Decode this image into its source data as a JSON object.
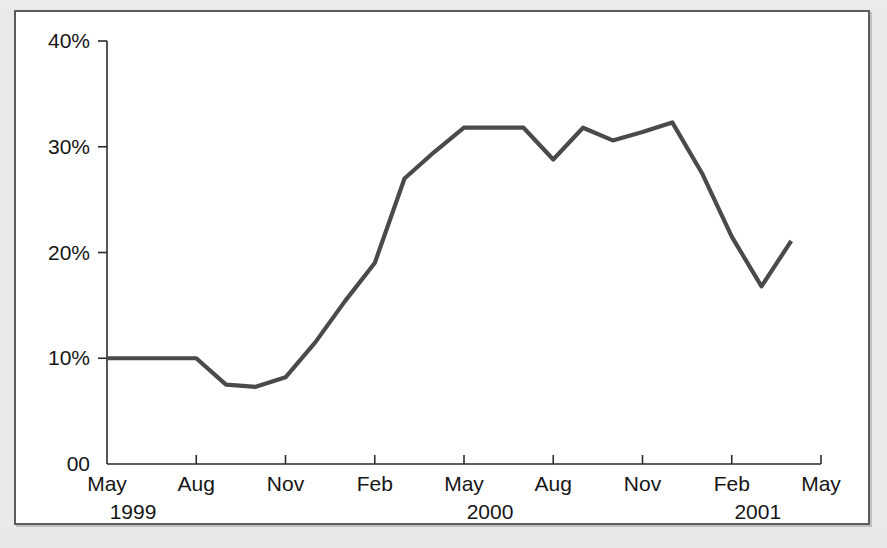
{
  "figure": {
    "panel_name": "chart-figure-panel",
    "background_color": "#ffffff",
    "page_background_color": "#e9e9e7",
    "border_color": "#5c5c5c"
  },
  "chart_data": {
    "type": "line",
    "title": "",
    "subtitle": "",
    "xlabel": "",
    "ylabel": "",
    "ylim": [
      0,
      40
    ],
    "xlim": [
      "May 1999",
      "May 2001"
    ],
    "grid": false,
    "legend": null,
    "legend_position": "none",
    "line_color": "#4a4a4a",
    "line_width_px": 4,
    "y_ticks": [
      {
        "value": 0,
        "label": "00"
      },
      {
        "value": 10,
        "label": "10%"
      },
      {
        "value": 20,
        "label": "20%"
      },
      {
        "value": 30,
        "label": "30%"
      },
      {
        "value": 40,
        "label": "40%"
      }
    ],
    "x_ticks": [
      {
        "month": "May",
        "year": "1999",
        "index": 0
      },
      {
        "month": "Aug",
        "year": "",
        "index": 3
      },
      {
        "month": "Nov",
        "year": "",
        "index": 6
      },
      {
        "month": "Feb",
        "year": "",
        "index": 9
      },
      {
        "month": "May",
        "year": "2000",
        "index": 12
      },
      {
        "month": "Aug",
        "year": "",
        "index": 15
      },
      {
        "month": "Nov",
        "year": "",
        "index": 18
      },
      {
        "month": "Feb",
        "year": "2001",
        "index": 21
      },
      {
        "month": "May",
        "year": "",
        "index": 24
      }
    ],
    "x_axis_year_labels": [
      {
        "label": "1999",
        "index": 0
      },
      {
        "label": "2000",
        "index": 12
      },
      {
        "label": "2001",
        "index": 21
      }
    ],
    "series": [
      {
        "name": "percentage",
        "x": [
          "May 1999",
          "Jun 1999",
          "Jul 1999",
          "Aug 1999",
          "Sep 1999",
          "Oct 1999",
          "Nov 1999",
          "Dec 1999",
          "Jan 2000",
          "Feb 2000",
          "Mar 2000",
          "Apr 2000",
          "May 2000",
          "Jun 2000",
          "Jul 2000",
          "Aug 2000",
          "Sep 2000",
          "Oct 2000",
          "Nov 2000",
          "Dec 2000",
          "Jan 2001",
          "Feb 2001",
          "Mar 2001",
          "Apr 2001"
        ],
        "values": [
          10.0,
          10.0,
          10.0,
          10.0,
          7.5,
          7.3,
          8.2,
          11.5,
          15.4,
          19.0,
          27.0,
          29.5,
          31.8,
          31.8,
          31.8,
          28.8,
          31.8,
          30.6,
          31.4,
          32.3,
          27.5,
          21.5,
          16.8,
          21.1
        ],
        "unit": "%"
      }
    ],
    "annotations": []
  }
}
